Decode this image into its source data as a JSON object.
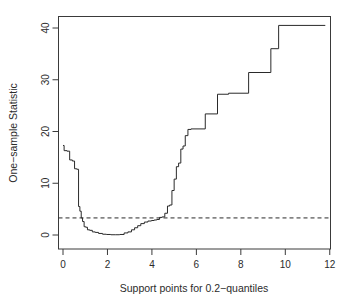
{
  "chart_data": {
    "type": "line",
    "title": "",
    "subtitle": "",
    "xlabel": "Support points for 0.2−quantiles",
    "ylabel": "One−sample Statistic",
    "xlim": [
      -0.35,
      12.35
    ],
    "ylim": [
      -1.6,
      42.5
    ],
    "xticks": [
      0,
      2,
      4,
      6,
      8,
      10,
      12
    ],
    "xtick_labels": [
      "0",
      "2",
      "4",
      "6",
      "8",
      "10",
      "12"
    ],
    "yticks": [
      0,
      10,
      20,
      30,
      40
    ],
    "ytick_labels": [
      "0",
      "10",
      "20",
      "30",
      "40"
    ],
    "grid": false,
    "legend": null,
    "legend_position": "none",
    "series": [
      {
        "name": "One-sample Statistic",
        "style": "step",
        "color": "#2a2a2a",
        "x": [
          0.0,
          0.05,
          0.18,
          0.3,
          0.42,
          0.52,
          0.62,
          0.7,
          0.76,
          0.82,
          0.88,
          0.95,
          1.02,
          1.1,
          1.2,
          1.32,
          1.45,
          1.6,
          1.78,
          1.95,
          2.15,
          2.35,
          2.55,
          2.75,
          2.92,
          3.08,
          3.22,
          3.36,
          3.5,
          3.66,
          3.82,
          3.98,
          4.1,
          4.22,
          4.34,
          4.46,
          4.58,
          4.7,
          4.8,
          4.9,
          5.0,
          5.1,
          5.2,
          5.3,
          5.4,
          5.5,
          5.62,
          5.76,
          6.4,
          6.95,
          7.45,
          8.35,
          9.35,
          9.7,
          11.8
        ],
        "y": [
          17.3,
          16.3,
          16.2,
          14.5,
          14.3,
          12.8,
          12.7,
          5.5,
          4.6,
          3.3,
          2.6,
          1.6,
          1.5,
          1.0,
          0.9,
          0.6,
          0.5,
          0.3,
          0.15,
          0.1,
          0.05,
          0.05,
          0.1,
          0.4,
          0.6,
          1.0,
          1.4,
          1.8,
          2.2,
          2.5,
          2.7,
          2.8,
          2.9,
          3.0,
          3.4,
          3.5,
          4.2,
          5.6,
          5.8,
          8.6,
          10.8,
          13.2,
          13.9,
          16.6,
          17.2,
          19.2,
          20.4,
          20.5,
          23.4,
          27.2,
          27.4,
          31.4,
          36.0,
          40.5,
          40.5
        ]
      }
    ],
    "annotations": [
      {
        "name": "critical-threshold",
        "type": "hline",
        "value": 3.3,
        "style": "dashed",
        "color": "#2a2a2a",
        "label": ""
      }
    ]
  },
  "axes": {
    "x_title": "Support points for 0.2−quantiles",
    "y_title": "One−sample Statistic",
    "x_tick_labels": [
      "0",
      "2",
      "4",
      "6",
      "8",
      "10",
      "12"
    ],
    "y_tick_labels": [
      "0",
      "10",
      "20",
      "30",
      "40"
    ]
  }
}
